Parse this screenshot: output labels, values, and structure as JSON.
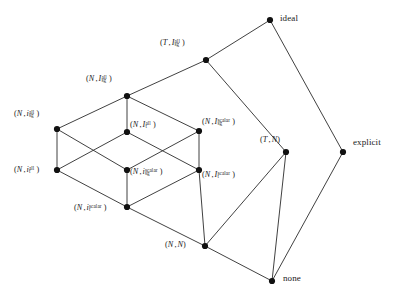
{
  "diagram": {
    "type": "hasse-lattice",
    "title": "",
    "nodes": [
      {
        "id": "ideal",
        "label": "ideal",
        "kind": "word",
        "x": 270,
        "y": 20,
        "label_x": 280,
        "label_y": 14
      },
      {
        "id": "T_Isg_all",
        "label": "(T , I sg all)",
        "base": "I",
        "var": "T",
        "sub": "sg",
        "sup": "all",
        "kind": "pair",
        "x": 206,
        "y": 60,
        "label_x": 160,
        "label_y": 38
      },
      {
        "id": "N_Isg_all",
        "label": "(N , I sg all)",
        "base": "I",
        "var": "N",
        "sub": "sg",
        "sup": "all",
        "kind": "pair",
        "x": 127,
        "y": 96,
        "label_x": 86,
        "label_y": 74
      },
      {
        "id": "N_isg_all",
        "label": "(N , i sg all)",
        "base": "i",
        "var": "N",
        "sub": "sg",
        "sup": "all",
        "kind": "pair",
        "x": 57,
        "y": 129,
        "label_x": 14,
        "label_y": 109
      },
      {
        "id": "N_It_all",
        "label": "(N , I t all)",
        "base": "I",
        "var": "N",
        "sub": "t",
        "sup": "all",
        "kind": "pair",
        "x": 127,
        "y": 132,
        "label_x": 130,
        "label_y": 120
      },
      {
        "id": "N_Isg_scalar",
        "label": "(N , I sg scalar)",
        "base": "I",
        "var": "N",
        "sub": "sg",
        "sup": "scalar",
        "kind": "pair",
        "x": 199,
        "y": 131,
        "label_x": 202,
        "label_y": 117
      },
      {
        "id": "N_it_all",
        "label": "(N , i t all)",
        "base": "i",
        "var": "N",
        "sub": "t",
        "sup": "all",
        "kind": "pair",
        "x": 57,
        "y": 170,
        "label_x": 14,
        "label_y": 165
      },
      {
        "id": "N_isg_scalar",
        "label": "(N , i sg scalar)",
        "base": "i",
        "var": "N",
        "sub": "sg",
        "sup": "scalar",
        "kind": "pair",
        "x": 127,
        "y": 170,
        "label_x": 130,
        "label_y": 167
      },
      {
        "id": "N_It_scalar",
        "label": "(N , I t scalar)",
        "base": "I",
        "var": "N",
        "sub": "t",
        "sup": "scalar",
        "kind": "pair",
        "x": 199,
        "y": 170,
        "label_x": 202,
        "label_y": 170
      },
      {
        "id": "N_it_scalar",
        "label": "(N , i t scalar)",
        "base": "i",
        "var": "N",
        "sub": "t",
        "sup": "scalar",
        "kind": "pair",
        "x": 127,
        "y": 207,
        "label_x": 74,
        "label_y": 203
      },
      {
        "id": "T_N",
        "label": "(T , N)",
        "kind": "pair-plain",
        "x": 286,
        "y": 152,
        "label_x": 260,
        "label_y": 136
      },
      {
        "id": "explicit",
        "label": "explicit",
        "kind": "word",
        "x": 343,
        "y": 152,
        "label_x": 353,
        "label_y": 138
      },
      {
        "id": "N_N",
        "label": "(N , N)",
        "kind": "pair-plain",
        "x": 205,
        "y": 246,
        "label_x": 165,
        "label_y": 241
      },
      {
        "id": "none",
        "label": "none",
        "kind": "word",
        "x": 272,
        "y": 281,
        "label_x": 283,
        "label_y": 274
      }
    ],
    "edges": [
      {
        "from": "ideal",
        "to": "T_Isg_all"
      },
      {
        "from": "ideal",
        "to": "explicit"
      },
      {
        "from": "T_Isg_all",
        "to": "N_Isg_all"
      },
      {
        "from": "T_Isg_all",
        "to": "T_N"
      },
      {
        "from": "N_Isg_all",
        "to": "N_isg_all"
      },
      {
        "from": "N_Isg_all",
        "to": "N_It_all"
      },
      {
        "from": "N_Isg_all",
        "to": "N_Isg_scalar"
      },
      {
        "from": "N_isg_all",
        "to": "N_it_all"
      },
      {
        "from": "N_isg_all",
        "to": "N_isg_scalar"
      },
      {
        "from": "N_It_all",
        "to": "N_it_all"
      },
      {
        "from": "N_It_all",
        "to": "N_It_scalar"
      },
      {
        "from": "N_Isg_scalar",
        "to": "N_isg_scalar"
      },
      {
        "from": "N_Isg_scalar",
        "to": "N_It_scalar"
      },
      {
        "from": "N_it_all",
        "to": "N_it_scalar"
      },
      {
        "from": "N_isg_scalar",
        "to": "N_it_scalar"
      },
      {
        "from": "N_It_scalar",
        "to": "N_it_scalar"
      },
      {
        "from": "N_it_scalar",
        "to": "N_N"
      },
      {
        "from": "N_It_scalar",
        "to": "N_N"
      },
      {
        "from": "T_N",
        "to": "N_N"
      },
      {
        "from": "T_N",
        "to": "none"
      },
      {
        "from": "explicit",
        "to": "none"
      },
      {
        "from": "N_N",
        "to": "none"
      }
    ],
    "colors": {
      "edge": "#2b2b2b",
      "node": "#111111",
      "text": "#1a1a1a",
      "background": "#ffffff"
    }
  }
}
